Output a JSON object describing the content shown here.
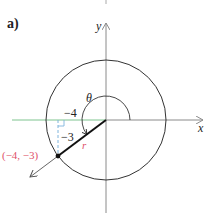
{
  "part_label": "a)",
  "axes": {
    "x_label": "x",
    "y_label": "y"
  },
  "angle_label": "θ",
  "legs": {
    "horizontal": "−4",
    "vertical": "−3"
  },
  "radius_label": "r",
  "point_label": "(−4, −3)",
  "colors": {
    "axis": "#8a8a8a",
    "circle": "#333333",
    "x_leg": "#7fc48f",
    "y_leg": "#7fb4dc",
    "point_label": "#e0506a",
    "radius_label": "#e0506a",
    "terminal_side": "#111111"
  }
}
